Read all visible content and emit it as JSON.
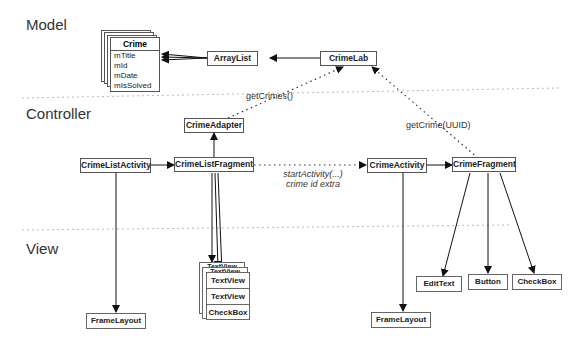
{
  "layers": {
    "model": "Model",
    "controller": "Controller",
    "view": "View"
  },
  "model": {
    "crime_class": {
      "title": "Crime",
      "fields": [
        "mTitle",
        "mId",
        "mDate",
        "mIsSolved"
      ]
    },
    "array_list": "ArrayList",
    "crime_lab": "CrimeLab"
  },
  "controller": {
    "crime_adapter": "CrimeAdapter",
    "crime_list_activity": "CrimeListActivity",
    "crime_list_fragment": "CrimeListFragment",
    "crime_activity": "CrimeActivity",
    "crime_fragment": "CrimeFragment"
  },
  "view": {
    "frame_layout_left": "FrameLayout",
    "frame_layout_right": "FrameLayout",
    "list_item": [
      "TextView",
      "TextView",
      "CheckBox"
    ],
    "list_item_back": [
      "TextView",
      "TextView"
    ],
    "edit_text": "EditText",
    "button": "Button",
    "checkbox": "CheckBox"
  },
  "annotations": {
    "get_crimes": "getCrimes()",
    "get_crime": "getCrime(UUID)",
    "start_activity": "startActivity(...)",
    "crime_id_extra": "crime id extra"
  }
}
